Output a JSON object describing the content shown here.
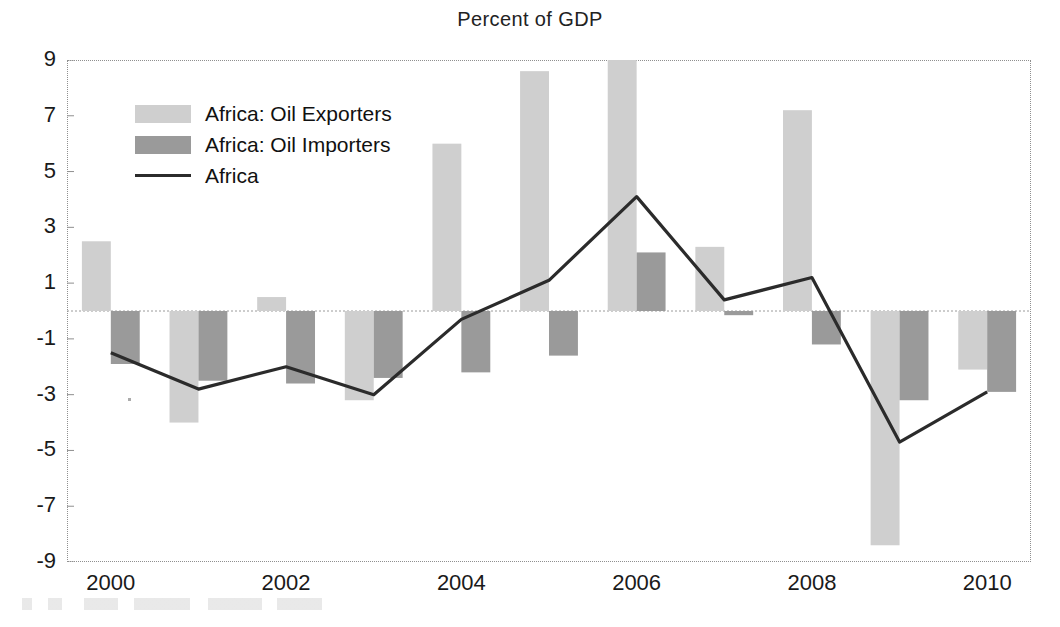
{
  "chart_data": {
    "type": "bar",
    "title": "Percent of GDP",
    "subtitle": "",
    "xlabel": "",
    "ylabel": "",
    "categories": [
      "2000",
      "2001",
      "2002",
      "2003",
      "2004",
      "2005",
      "2006",
      "2007",
      "2008",
      "2009",
      "2010"
    ],
    "x_tick_labels": [
      "2000",
      "2002",
      "2004",
      "2006",
      "2008",
      "2010"
    ],
    "y_tick_labels": [
      "9",
      "7",
      "5",
      "3",
      "1",
      "-1",
      "-3",
      "-5",
      "-7",
      "-9"
    ],
    "y_tick_values": [
      9,
      7,
      5,
      3,
      1,
      -1,
      -3,
      -5,
      -7,
      -9
    ],
    "ylim": [
      -9,
      9
    ],
    "grid": false,
    "zero_line": true,
    "legend_position": "upper-left",
    "series": [
      {
        "name": "Africa: Oil Exporters",
        "type": "bar",
        "color": "#cfcfcf",
        "values": [
          2.5,
          -4.0,
          0.5,
          -3.2,
          6.0,
          8.6,
          9.4,
          2.3,
          7.2,
          -8.4,
          -2.1
        ]
      },
      {
        "name": "Africa: Oil Importers",
        "type": "bar",
        "color": "#9a9a9a",
        "values": [
          -1.9,
          -2.5,
          -2.6,
          -2.4,
          -2.2,
          -1.6,
          2.1,
          -0.15,
          -1.2,
          -3.2,
          -2.9
        ]
      },
      {
        "name": "Africa",
        "type": "line",
        "color": "#2b2b2b",
        "values": [
          -1.5,
          -2.8,
          -2.0,
          -3.0,
          -0.3,
          1.1,
          4.1,
          0.4,
          1.2,
          -4.7,
          -2.9
        ]
      }
    ]
  },
  "figure": {
    "title": "Percent of GDP"
  },
  "legend": {
    "items": [
      {
        "label": "Africa: Oil Exporters",
        "marker": "swatch-light-gray"
      },
      {
        "label": "Africa: Oil Importers",
        "marker": "swatch-dark-gray"
      },
      {
        "label": "Africa",
        "marker": "line-dark"
      }
    ]
  },
  "colors": {
    "exporters": "#cfcfcf",
    "importers": "#9a9a9a",
    "line": "#2b2b2b",
    "axis": "#8f8f8f",
    "background": "#ffffff"
  }
}
